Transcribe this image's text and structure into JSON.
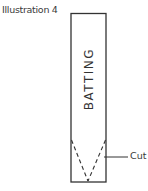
{
  "illustration": {
    "caption": "Illustration 4",
    "strip_label": "BATTING",
    "cut_label": "Cut",
    "line_color": "#333333"
  }
}
